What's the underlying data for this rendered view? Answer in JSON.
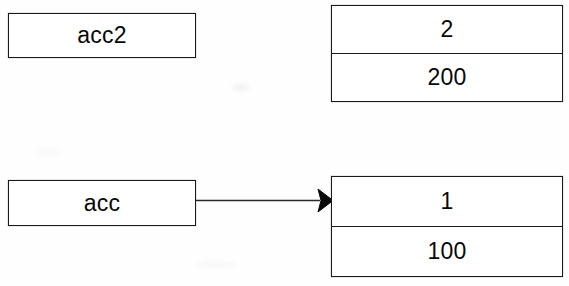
{
  "diagram": {
    "background_color": "#ffffff",
    "ink_color": "#1a1a1a",
    "nodes": [
      {
        "id": "acc2",
        "name": "pointer-variable-acc2",
        "label": "acc2",
        "kind": "variable-box",
        "connected": false
      },
      {
        "id": "obj2",
        "name": "object-box-2",
        "kind": "object-box",
        "fields": [
          {
            "name": "id-field",
            "value": "2"
          },
          {
            "name": "balance-field",
            "value": "200"
          }
        ]
      },
      {
        "id": "acc",
        "name": "pointer-variable-acc",
        "label": "acc",
        "kind": "variable-box",
        "connected": true
      },
      {
        "id": "obj1",
        "name": "object-box-1",
        "kind": "object-box",
        "fields": [
          {
            "name": "id-field",
            "value": "1"
          },
          {
            "name": "balance-field",
            "value": "100"
          }
        ]
      }
    ],
    "edges": [
      {
        "name": "acc-to-object-1",
        "from": "acc",
        "to": "obj1",
        "style": "solid-line",
        "arrowhead": "filled-triangle",
        "label": ""
      }
    ]
  }
}
